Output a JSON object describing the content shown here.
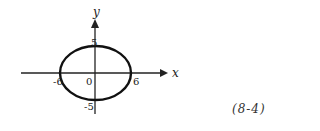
{
  "figure": {
    "axis_labels": {
      "x": "x",
      "y": "y"
    },
    "ticks": {
      "x_neg": "-6",
      "x_pos": "6",
      "origin": "0",
      "y_pos": "5",
      "y_neg": "-5"
    },
    "equation_number": "(8-4)"
  },
  "shape": {
    "type": "ellipse",
    "semi_major_x": 6,
    "semi_minor_y": 5,
    "center": [
      0,
      0
    ]
  }
}
